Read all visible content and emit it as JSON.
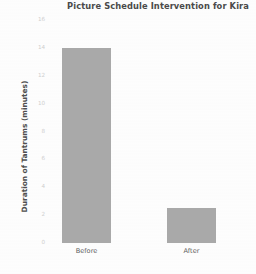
{
  "chart_data": {
    "type": "bar",
    "title": "Picture Schedule Intervention for Kira",
    "xlabel": "",
    "ylabel": "Duration of Tantrums (minutes)",
    "categories": [
      "Before",
      "After"
    ],
    "values": [
      14,
      2.5
    ],
    "series": [
      {
        "name": "Duration of Tantrums (minutes)",
        "values": [
          14,
          2.5
        ]
      }
    ],
    "ylim": [
      0,
      16
    ],
    "yticks": [
      "0",
      "2",
      "4",
      "6",
      "8",
      "10",
      "12",
      "14",
      "16"
    ],
    "ytick_values": [
      0,
      2,
      4,
      6,
      8,
      10,
      12,
      14,
      16
    ],
    "grid": false,
    "legend": false,
    "bar_color": "#a9a9a9",
    "background_color": "#fdfdfd",
    "title_color": "#4a4a4a",
    "axis_label_color": "#4f4f4f",
    "tick_label_color": "#cfcfcf"
  }
}
